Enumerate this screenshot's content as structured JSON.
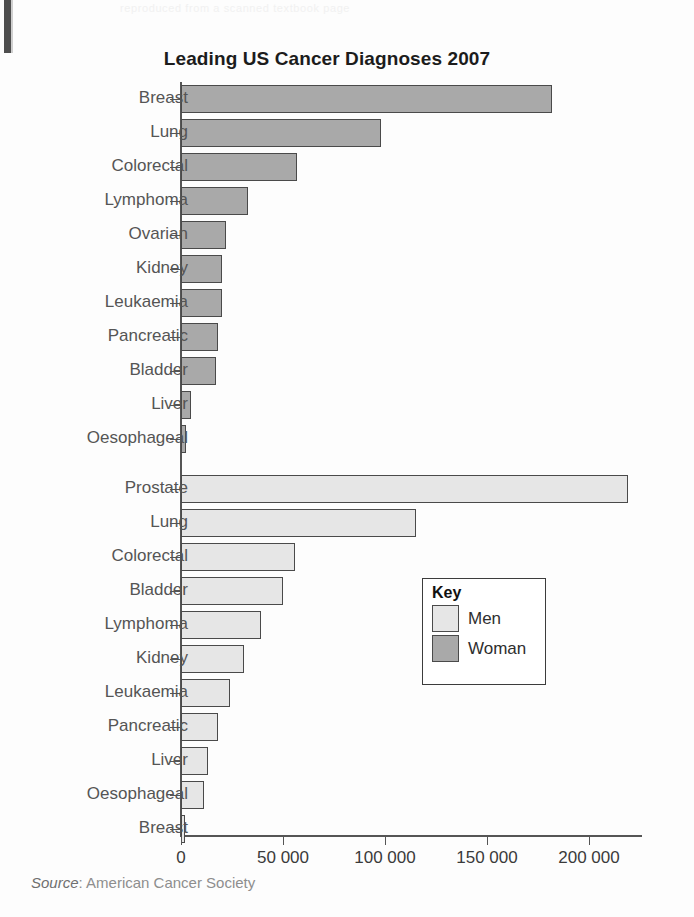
{
  "page": {
    "background_color": "#fdfdfd",
    "scan_artifact_color": "#3f3f3f",
    "top_bleed_text": "reproduced from a scanned textbook page"
  },
  "chart_data": {
    "type": "bar",
    "orientation": "horizontal",
    "title": "Leading US Cancer Diagnoses 2007",
    "xlabel": "",
    "ylabel": "",
    "xlim": [
      0,
      227000
    ],
    "grid": false,
    "legend_position": "middle-right",
    "x_ticks": [
      0,
      50000,
      100000,
      150000,
      200000
    ],
    "x_tick_labels": [
      "0",
      "50 000",
      "100 000",
      "150 000",
      "200 000"
    ],
    "series": [
      {
        "name": "Woman",
        "color": "#a9a9a9",
        "categories": [
          "Breast",
          "Lung",
          "Colorectal",
          "Lymphoma",
          "Ovarian",
          "Kidney",
          "Leukaemia",
          "Pancreatic",
          "Bladder",
          "Liver",
          "Oesophageal"
        ],
        "values": [
          182000,
          98000,
          57000,
          33000,
          22000,
          20000,
          20000,
          18000,
          17000,
          5000,
          2500
        ]
      },
      {
        "name": "Men",
        "color": "#e6e6e6",
        "categories": [
          "Prostate",
          "Lung",
          "Colorectal",
          "Bladder",
          "Lymphoma",
          "Kidney",
          "Leukaemia",
          "Pancreatic",
          "Liver",
          "Oesophageal",
          "Breast"
        ],
        "values": [
          219000,
          115000,
          56000,
          50000,
          39000,
          31000,
          24000,
          18000,
          13000,
          11500,
          2000
        ]
      }
    ],
    "legend": {
      "title": "Key",
      "entries": [
        {
          "label": "Men",
          "color": "#e6e6e6"
        },
        {
          "label": "Woman",
          "color": "#a9a9a9"
        }
      ]
    },
    "source": {
      "prefix": "Source",
      "separator": ": ",
      "text": "American Cancer Society"
    }
  }
}
